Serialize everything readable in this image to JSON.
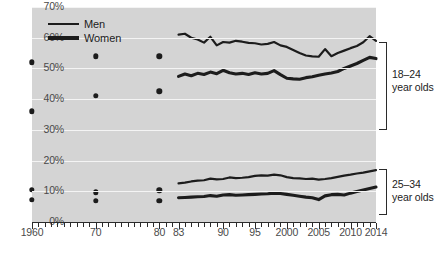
{
  "chart_data": {
    "type": "line",
    "title": "",
    "subtitle": "",
    "xlabel": "",
    "ylabel": "",
    "ylim": [
      0,
      70
    ],
    "xlim": [
      1960,
      2014
    ],
    "grid": true,
    "legend_position": "top-left",
    "y_ticks": [
      "0%",
      "10%",
      "20%",
      "30%",
      "40%",
      "50%",
      "60%",
      "70%"
    ],
    "y_tick_values": [
      0,
      10,
      20,
      30,
      40,
      50,
      60,
      70
    ],
    "x_ticks": [
      "1960",
      "70",
      "80",
      "83",
      "90",
      "95",
      "2000",
      "2005",
      "2010",
      "2014"
    ],
    "x_tick_values": [
      1960,
      1970,
      1980,
      1983,
      1990,
      1995,
      2000,
      2005,
      2010,
      2014
    ],
    "legend": [
      {
        "name": "Men",
        "color": "#1c1c1c",
        "width": 2.6
      },
      {
        "name": "Women",
        "color": "#1c1c1c",
        "width": 3.6
      }
    ],
    "group_labels": [
      {
        "text_line1": "18–24",
        "text_line2": "year olds"
      },
      {
        "text_line1": "25–34",
        "text_line2": "year olds"
      }
    ],
    "decennial_points": [
      {
        "group": "18-24",
        "series": "Men",
        "x": 1960,
        "y": 52.0
      },
      {
        "group": "18-24",
        "series": "Men",
        "x": 1970,
        "y": 54.0
      },
      {
        "group": "18-24",
        "series": "Men",
        "x": 1980,
        "y": 54.0
      },
      {
        "group": "18-24",
        "series": "Women",
        "x": 1960,
        "y": 36.0
      },
      {
        "group": "18-24",
        "series": "Women",
        "x": 1970,
        "y": 41.0
      },
      {
        "group": "18-24",
        "series": "Women",
        "x": 1980,
        "y": 42.5
      },
      {
        "group": "25-34",
        "series": "Men",
        "x": 1960,
        "y": 10.5
      },
      {
        "group": "25-34",
        "series": "Men",
        "x": 1970,
        "y": 9.7
      },
      {
        "group": "25-34",
        "series": "Men",
        "x": 1980,
        "y": 10.3
      },
      {
        "group": "25-34",
        "series": "Women",
        "x": 1960,
        "y": 7.3
      },
      {
        "group": "25-34",
        "series": "Women",
        "x": 1970,
        "y": 6.9
      },
      {
        "group": "25-34",
        "series": "Women",
        "x": 1980,
        "y": 7.0
      }
    ],
    "x": [
      1983,
      1984,
      1985,
      1986,
      1987,
      1988,
      1989,
      1990,
      1991,
      1992,
      1993,
      1994,
      1995,
      1996,
      1997,
      1998,
      1999,
      2000,
      2001,
      2002,
      2003,
      2004,
      2005,
      2006,
      2007,
      2008,
      2009,
      2010,
      2011,
      2012,
      2013,
      2014
    ],
    "series": [
      {
        "name": "Men 18-24",
        "group": "18-24",
        "sex": "Men",
        "values": [
          61.0,
          61.3,
          60.0,
          59.4,
          58.4,
          60.3,
          57.5,
          58.6,
          58.4,
          59.0,
          58.7,
          58.3,
          58.2,
          57.8,
          58.0,
          58.6,
          57.5,
          57.0,
          56.0,
          55.0,
          54.2,
          53.9,
          53.8,
          56.3,
          54.0,
          55.0,
          55.8,
          56.6,
          57.3,
          58.5,
          60.5,
          59.0
        ]
      },
      {
        "name": "Women 18-24",
        "group": "18-24",
        "sex": "Women",
        "values": [
          47.4,
          48.2,
          47.6,
          48.4,
          48.0,
          48.8,
          48.3,
          49.4,
          48.6,
          48.2,
          48.4,
          48.0,
          48.6,
          48.2,
          48.4,
          49.3,
          48.0,
          46.8,
          46.6,
          46.5,
          47.0,
          47.3,
          47.8,
          48.2,
          48.5,
          49.0,
          50.0,
          50.8,
          51.6,
          52.6,
          53.6,
          53.2
        ]
      },
      {
        "name": "Men 25-34",
        "group": "25-34",
        "sex": "Men",
        "values": [
          12.6,
          12.8,
          13.2,
          13.5,
          13.6,
          14.1,
          13.9,
          14.0,
          14.5,
          14.3,
          14.4,
          14.6,
          15.0,
          15.2,
          15.1,
          15.4,
          15.2,
          14.6,
          14.3,
          14.2,
          14.0,
          14.1,
          13.8,
          14.0,
          14.3,
          14.7,
          15.1,
          15.4,
          15.8,
          16.1,
          16.5,
          16.9
        ]
      },
      {
        "name": "Women 25-34",
        "group": "25-34",
        "sex": "Women",
        "values": [
          7.9,
          8.0,
          8.1,
          8.2,
          8.3,
          8.6,
          8.4,
          8.8,
          8.9,
          8.7,
          8.8,
          8.9,
          9.0,
          9.1,
          9.2,
          9.4,
          9.3,
          9.0,
          8.7,
          8.4,
          8.1,
          7.9,
          7.3,
          8.5,
          8.9,
          9.0,
          8.8,
          9.4,
          9.9,
          10.4,
          10.9,
          11.4
        ]
      }
    ]
  }
}
